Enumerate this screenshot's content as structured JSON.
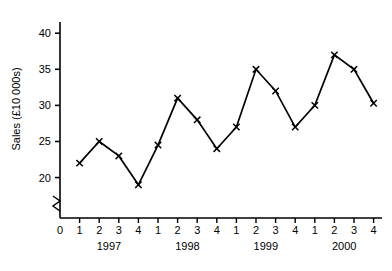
{
  "chart_data": {
    "type": "line",
    "title": "",
    "xlabel": "",
    "ylabel": "Sales (£10 000s)",
    "ylim": [
      18,
      41
    ],
    "yticks": [
      20,
      25,
      30,
      35,
      40
    ],
    "ytick_labels": [
      "20",
      "25",
      "30",
      "35",
      "40"
    ],
    "grid": false,
    "legend": null,
    "y_axis_break": true,
    "x_origin_label": "0",
    "categories": [
      "1997 Q1",
      "1997 Q2",
      "1997 Q3",
      "1997 Q4",
      "1998 Q1",
      "1998 Q2",
      "1998 Q3",
      "1998 Q4",
      "1999 Q1",
      "1999 Q2",
      "1999 Q3",
      "1999 Q4",
      "2000 Q1",
      "2000 Q2",
      "2000 Q3",
      "2000 Q4"
    ],
    "quarter_labels": [
      "1",
      "2",
      "3",
      "4",
      "1",
      "2",
      "3",
      "4",
      "1",
      "2",
      "3",
      "4",
      "1",
      "2",
      "3",
      "4"
    ],
    "year_groups": [
      {
        "label": "1997",
        "quarters": [
          "1",
          "2",
          "3",
          "4"
        ]
      },
      {
        "label": "1998",
        "quarters": [
          "1",
          "2",
          "3",
          "4"
        ]
      },
      {
        "label": "1999",
        "quarters": [
          "1",
          "2",
          "3",
          "4"
        ]
      },
      {
        "label": "2000",
        "quarters": [
          "1",
          "2",
          "3",
          "4"
        ]
      }
    ],
    "values": [
      22,
      25,
      23,
      19,
      24.5,
      31,
      28,
      24,
      27,
      35,
      32,
      27,
      30,
      37,
      35,
      30.3
    ],
    "marker": "x",
    "line_color": "#000000",
    "marker_color": "#000000"
  }
}
